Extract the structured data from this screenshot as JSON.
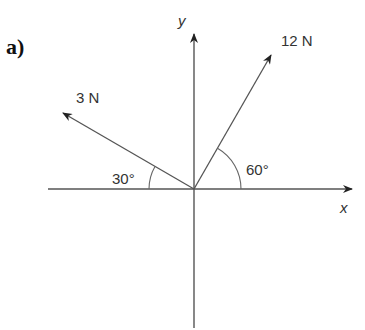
{
  "part_label": "a)",
  "axes": {
    "x_label": "x",
    "y_label": "y"
  },
  "forces": [
    {
      "label": "12 N",
      "magnitude": 12,
      "unit": "N",
      "angle_label": "60°",
      "angle_deg": 60,
      "reference": "positive x-axis"
    },
    {
      "label": "3 N",
      "magnitude": 3,
      "unit": "N",
      "angle_label": "30°",
      "angle_deg": 30,
      "reference": "negative x-axis"
    }
  ],
  "colors": {
    "line": "#555555",
    "text": "#333333"
  }
}
